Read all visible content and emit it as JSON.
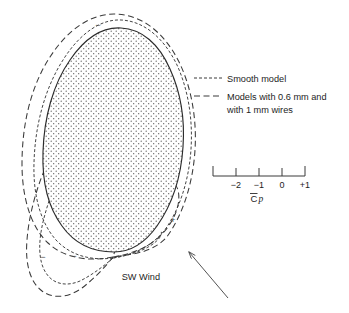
{
  "figure": {
    "type": "wind-pressure-distribution-diagram"
  },
  "legend": {
    "items": [
      {
        "key": "smooth-model",
        "label": "Smooth model",
        "line_style": "short-dash",
        "dash_pattern": "3,2",
        "color": "#3a3a3a"
      },
      {
        "key": "wire-models",
        "label": "Models with 0.6 mm and",
        "label_line2": "with 1 mm wires",
        "line_style": "long-dash",
        "dash_pattern": "6,3.5",
        "color": "#3a3a3a"
      }
    ]
  },
  "scale_bar": {
    "title_c": "C",
    "title_p": "p",
    "overbar": true,
    "ticks": [
      {
        "value": "",
        "label": ""
      },
      {
        "value": "-2",
        "label": "−2"
      },
      {
        "value": "-1",
        "label": "−1"
      },
      {
        "value": "0",
        "label": "0"
      },
      {
        "value": "+1",
        "label": "+1"
      }
    ]
  },
  "annotations": {
    "wind": {
      "label": "SW Wind",
      "arrow": "up-left"
    },
    "signs": [
      {
        "symbol": "−",
        "position": "top"
      },
      {
        "symbol": "+",
        "position": "right-lobe"
      },
      {
        "symbol": "−",
        "position": "bottom-left-inner"
      },
      {
        "symbol": "−",
        "position": "bottom-left-outer"
      }
    ]
  },
  "colors": {
    "ink": "#1d1d1d",
    "curve": "#3a3a3a",
    "outline": "#2b2b2b",
    "stipple": "#5a5a5a",
    "background": "#ffffff"
  }
}
